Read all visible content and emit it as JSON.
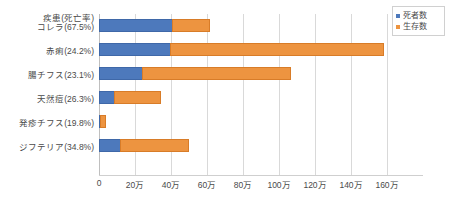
{
  "axis_title": "疾患(死亡率)",
  "legend": {
    "position": "top-right",
    "items": [
      {
        "label": "死者数",
        "color": "#4d79bc",
        "key": "deaths"
      },
      {
        "label": "生存数",
        "color": "#ed9440",
        "key": "survivors"
      }
    ]
  },
  "xaxis": {
    "ticks": [
      "0",
      "20万",
      "40万",
      "60万",
      "80万",
      "100万",
      "120万",
      "140万",
      "160万"
    ]
  },
  "rows": [
    {
      "label": "コレラ(67.5%)",
      "deaths": 410000,
      "survivors": 210000
    },
    {
      "label": "赤痢(24.2%)",
      "deaths": 400000,
      "survivors": 1190000
    },
    {
      "label": "腸チフス(23.1%)",
      "deaths": 245000,
      "survivors": 830000
    },
    {
      "label": "天然痘(26.3%)",
      "deaths": 90000,
      "survivors": 260000
    },
    {
      "label": "発疹チフス(19.8%)",
      "deaths": 7000,
      "survivors": 33000
    },
    {
      "label": "ジフテリア(34.8%)",
      "deaths": 120000,
      "survivors": 385000
    }
  ],
  "chart_data": {
    "type": "bar",
    "orientation": "horizontal",
    "stacked": true,
    "title": "",
    "subtitle": "",
    "xlabel": "",
    "ylabel": "疾患(死亡率)",
    "categories": [
      "コレラ(67.5%)",
      "赤痢(24.2%)",
      "腸チフス(23.1%)",
      "天然痘(26.3%)",
      "発疹チフス(19.8%)",
      "ジフテリア(34.8%)"
    ],
    "series": [
      {
        "name": "死者数",
        "color": "#4d79bc",
        "values": [
          410000,
          400000,
          245000,
          90000,
          7000,
          120000
        ]
      },
      {
        "name": "生存数",
        "color": "#ed9440",
        "values": [
          210000,
          1190000,
          830000,
          260000,
          33000,
          385000
        ]
      }
    ],
    "xlim": [
      0,
      1600000
    ],
    "xticks": [
      0,
      200000,
      400000,
      600000,
      800000,
      1000000,
      1200000,
      1400000,
      1600000
    ],
    "xticklabels": [
      "0",
      "20万",
      "40万",
      "60万",
      "80万",
      "100万",
      "120万",
      "140万",
      "160万"
    ],
    "grid": "vertical",
    "legend_position": "top-right",
    "unit": "万 = 10,000 people"
  }
}
